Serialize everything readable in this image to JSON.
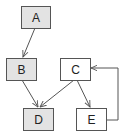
{
  "diagram": {
    "type": "directed-graph",
    "colors": {
      "filled_node": "#e3e3e3",
      "plain_node": "#ffffff",
      "stroke": "#555555",
      "edge": "#555555",
      "text": "#222222"
    },
    "nodes": [
      {
        "id": "A",
        "label": "A",
        "filled": true,
        "x": 21,
        "y": 6,
        "w": 29,
        "h": 22
      },
      {
        "id": "B",
        "label": "B",
        "filled": true,
        "x": 6,
        "y": 58,
        "w": 30,
        "h": 22
      },
      {
        "id": "C",
        "label": "C",
        "filled": false,
        "x": 60,
        "y": 58,
        "w": 30,
        "h": 22
      },
      {
        "id": "D",
        "label": "D",
        "filled": true,
        "x": 23,
        "y": 108,
        "w": 30,
        "h": 22
      },
      {
        "id": "E",
        "label": "E",
        "filled": false,
        "x": 76,
        "y": 108,
        "w": 30,
        "h": 22
      }
    ],
    "edges": [
      {
        "from": "A",
        "to": "B"
      },
      {
        "from": "B",
        "to": "D"
      },
      {
        "from": "C",
        "to": "D"
      },
      {
        "from": "C",
        "to": "E"
      },
      {
        "from": "E",
        "to": "C",
        "routing": "right-loop"
      }
    ]
  }
}
